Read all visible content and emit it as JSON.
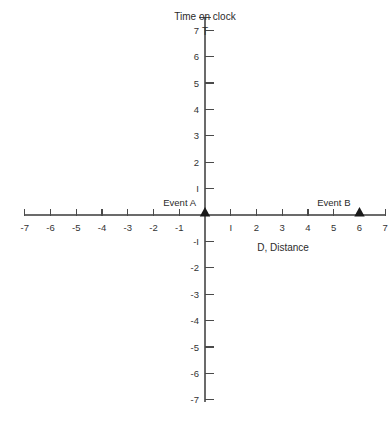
{
  "chart_data": {
    "type": "scatter",
    "title": "Time on clock",
    "xlabel": "D, Distance",
    "ylabel": "T",
    "ylabel_full": "Time on clock",
    "grid": false,
    "legend": "none",
    "xlim": [
      -7,
      7
    ],
    "ylim": [
      -7,
      7
    ],
    "xticks": [
      -7,
      -6,
      -5,
      -4,
      -3,
      -2,
      -1,
      1,
      2,
      3,
      4,
      5,
      6,
      7
    ],
    "xtick_labels": [
      "-7",
      "-6",
      "-5",
      "-4",
      "-3",
      "-2",
      "-1",
      "I",
      "2",
      "3",
      "4",
      "5",
      "6",
      "7"
    ],
    "yticks": [
      7,
      6,
      5,
      4,
      3,
      2,
      1,
      -1,
      -2,
      -3,
      -4,
      -5,
      -6,
      -7
    ],
    "ytick_labels": [
      "7",
      "6",
      "5",
      "4",
      "3",
      "2",
      "I",
      "-I",
      "-2",
      "-3",
      "-4",
      "-5",
      "-6",
      "-7"
    ],
    "points": [
      {
        "name": "Event A",
        "label": "Event A",
        "x": 0,
        "y": 0,
        "marker": "triangle",
        "color": "#1a1a1a"
      },
      {
        "name": "Event B",
        "label": "Event B",
        "x": 6,
        "y": 0,
        "marker": "triangle",
        "color": "#1a1a1a"
      }
    ],
    "colors": {
      "axis": "#6b6b6b",
      "tick": "#4a4a4a",
      "text": "#2b2b2b",
      "marker": "#1a1a1a",
      "background": "#ffffff"
    }
  }
}
